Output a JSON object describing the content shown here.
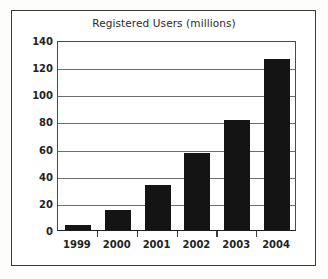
{
  "chart_data": {
    "type": "bar",
    "title": "Registered Users (millions)",
    "categories": [
      "1999",
      "2000",
      "2001",
      "2002",
      "2003",
      "2004"
    ],
    "values": [
      4,
      15,
      33,
      57,
      81,
      126
    ],
    "xlabel": "",
    "ylabel": "",
    "ylim": [
      0,
      140
    ],
    "yticks": [
      0,
      20,
      40,
      60,
      80,
      100,
      120,
      140
    ],
    "ytick_labels": [
      "0",
      "20",
      "40",
      "60",
      "80",
      "100",
      "120",
      "140"
    ],
    "grid": true,
    "legend": false,
    "bar_color": "#141414",
    "grid_color": "#6e6e6c",
    "axis_color": "#1e1e1e",
    "border_color": "#3a3a38"
  }
}
